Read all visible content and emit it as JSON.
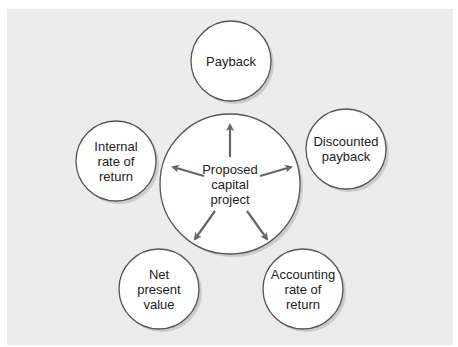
{
  "diagram": {
    "center": {
      "label": "Proposed\ncapital\nproject",
      "cx": 230,
      "cy": 184,
      "r": 70
    },
    "methods": [
      {
        "id": "payback",
        "label": "Payback",
        "cx": 231,
        "cy": 61,
        "r": 40
      },
      {
        "id": "discounted-payback",
        "label": "Discounted\npayback",
        "cx": 346,
        "cy": 149,
        "r": 40
      },
      {
        "id": "accounting-rate-of-return",
        "label": "Accounting\nrate of\nreturn",
        "cx": 303,
        "cy": 289,
        "r": 40
      },
      {
        "id": "net-present-value",
        "label": "Net\npresent\nvalue",
        "cx": 159,
        "cy": 289,
        "r": 40
      },
      {
        "id": "internal-rate-of-return",
        "label": "Internal\nrate of\nreturn",
        "cx": 116,
        "cy": 161,
        "r": 40
      }
    ],
    "arrows": [
      {
        "to": "payback",
        "x1": 230,
        "y1": 157,
        "x2": 230,
        "y2": 125
      },
      {
        "to": "discounted-payback",
        "x1": 260,
        "y1": 176,
        "x2": 291,
        "y2": 167
      },
      {
        "to": "accounting-rate-of-return",
        "x1": 247,
        "y1": 211,
        "x2": 267,
        "y2": 239
      },
      {
        "to": "net-present-value",
        "x1": 215,
        "y1": 211,
        "x2": 195,
        "y2": 239
      },
      {
        "to": "internal-rate-of-return",
        "x1": 204,
        "y1": 176,
        "x2": 173,
        "y2": 167
      }
    ],
    "colors": {
      "background": "#ececec",
      "circle_fill": "#ffffff",
      "circle_stroke": "#555555",
      "arrow": "#666666",
      "shadow": "#bdbdbd"
    }
  }
}
